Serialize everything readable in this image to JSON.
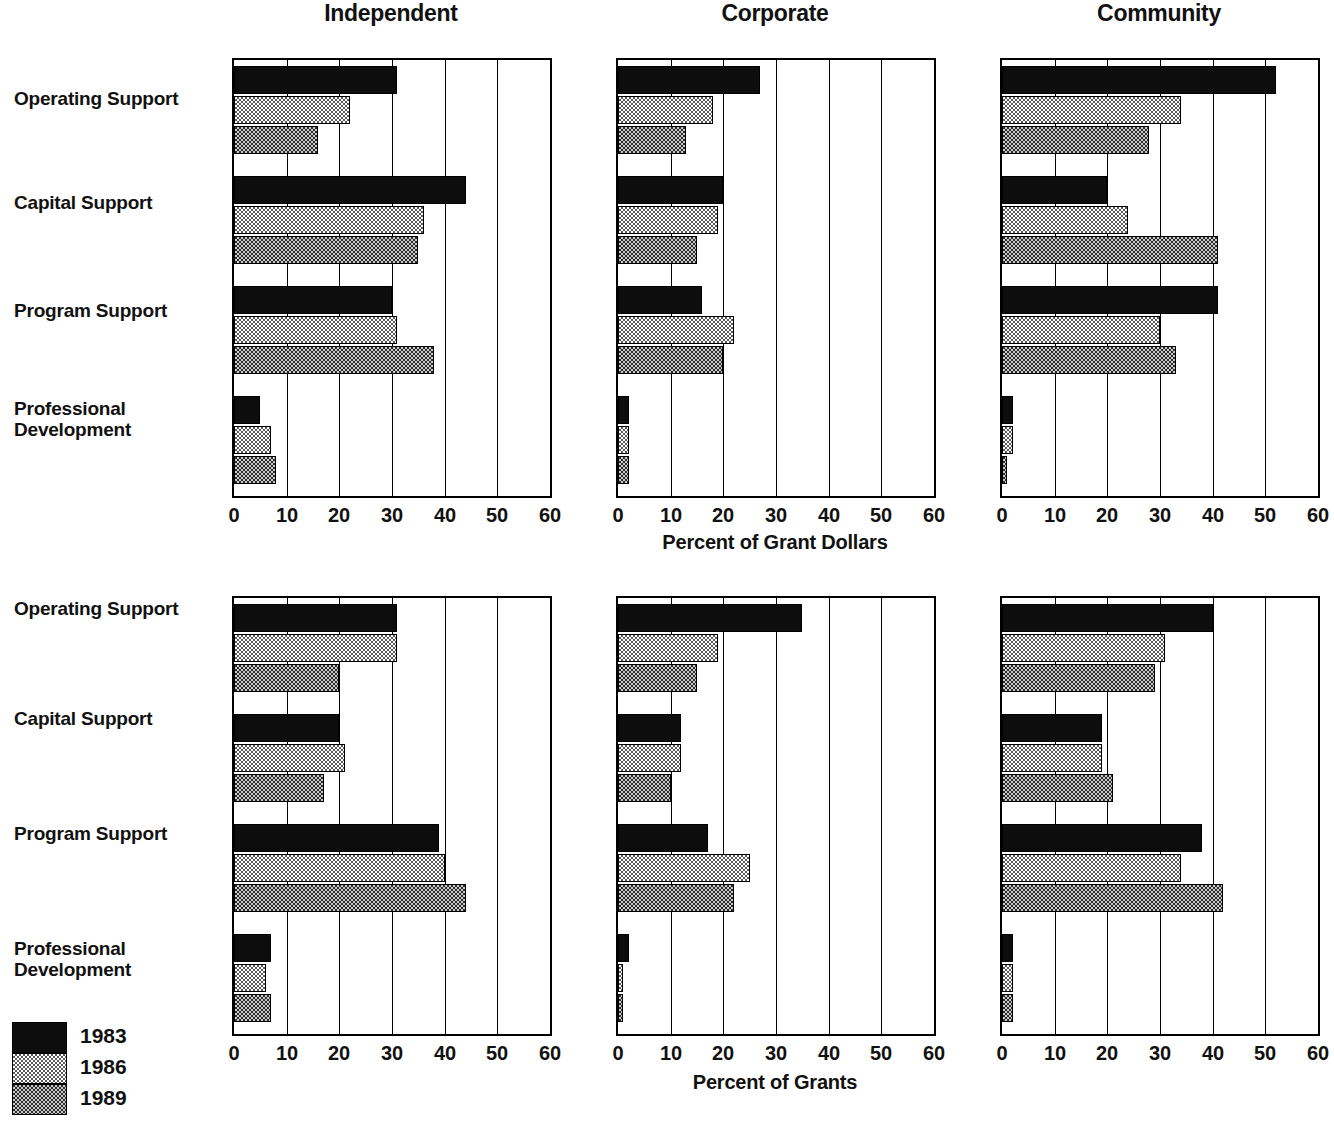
{
  "chart_data": [
    {
      "type": "bar",
      "orientation": "horizontal",
      "title": "",
      "xlabel": "Percent of Grant Dollars",
      "ylabel": "",
      "xlim": [
        0,
        60
      ],
      "xticks": [
        0,
        10,
        20,
        30,
        40,
        50,
        60
      ],
      "grid": true,
      "legend": [
        "1983",
        "1986",
        "1989"
      ],
      "legend_position": "bottom-left",
      "categories": [
        "Operating Support",
        "Capital Support",
        "Program Support",
        "Professional Development"
      ],
      "panels": [
        {
          "name": "Independent",
          "series": [
            {
              "name": "1983",
              "values": [
                31,
                44,
                30,
                5
              ]
            },
            {
              "name": "1986",
              "values": [
                22,
                36,
                31,
                7
              ]
            },
            {
              "name": "1989",
              "values": [
                16,
                35,
                38,
                8
              ]
            }
          ]
        },
        {
          "name": "Corporate",
          "series": [
            {
              "name": "1983",
              "values": [
                27,
                20,
                16,
                2
              ]
            },
            {
              "name": "1986",
              "values": [
                18,
                19,
                22,
                2
              ]
            },
            {
              "name": "1989",
              "values": [
                13,
                15,
                20,
                2
              ]
            }
          ]
        },
        {
          "name": "Community",
          "series": [
            {
              "name": "1983",
              "values": [
                52,
                20,
                41,
                2
              ]
            },
            {
              "name": "1986",
              "values": [
                34,
                24,
                30,
                2
              ]
            },
            {
              "name": "1989",
              "values": [
                28,
                41,
                33,
                1
              ]
            }
          ]
        }
      ]
    },
    {
      "type": "bar",
      "orientation": "horizontal",
      "title": "",
      "xlabel": "Percent of Grants",
      "ylabel": "",
      "xlim": [
        0,
        60
      ],
      "xticks": [
        0,
        10,
        20,
        30,
        40,
        50,
        60
      ],
      "grid": true,
      "legend": [
        "1983",
        "1986",
        "1989"
      ],
      "legend_position": "bottom-left",
      "categories": [
        "Operating Support",
        "Capital Support",
        "Program Support",
        "Professional Development"
      ],
      "panels": [
        {
          "name": "Independent",
          "series": [
            {
              "name": "1983",
              "values": [
                31,
                20,
                39,
                7
              ]
            },
            {
              "name": "1986",
              "values": [
                31,
                21,
                40,
                6
              ]
            },
            {
              "name": "1989",
              "values": [
                20,
                17,
                44,
                7
              ]
            }
          ]
        },
        {
          "name": "Corporate",
          "series": [
            {
              "name": "1983",
              "values": [
                35,
                12,
                17,
                2
              ]
            },
            {
              "name": "1986",
              "values": [
                19,
                12,
                25,
                1
              ]
            },
            {
              "name": "1989",
              "values": [
                15,
                10,
                22,
                1
              ]
            }
          ]
        },
        {
          "name": "Community",
          "series": [
            {
              "name": "1983",
              "values": [
                40,
                19,
                38,
                2
              ]
            },
            {
              "name": "1986",
              "values": [
                31,
                19,
                34,
                2
              ]
            },
            {
              "name": "1989",
              "values": [
                29,
                21,
                42,
                2
              ]
            }
          ]
        }
      ]
    }
  ],
  "categories": {
    "c0": "Operating Support",
    "c1": "Capital Support",
    "c2": "Program Support",
    "c3_line1": "Professional",
    "c3_line2": "Development"
  },
  "panel_titles": {
    "independent": "Independent",
    "corporate": "Corporate",
    "community": "Community"
  },
  "axis": {
    "ticks": {
      "t0": "0",
      "t1": "10",
      "t2": "20",
      "t3": "30",
      "t4": "40",
      "t5": "50",
      "t6": "60"
    },
    "top_label": "Percent of Grant Dollars",
    "bottom_label": "Percent of Grants"
  },
  "legend": {
    "y1983": "1983",
    "y1986": "1986",
    "y1989": "1989"
  },
  "colors": {
    "bar_1983": "#0d0d0d",
    "bar_1986": "#c9c9c9",
    "bar_1989": "#4a4a4a",
    "axis": "#000000",
    "background": "#ffffff"
  }
}
